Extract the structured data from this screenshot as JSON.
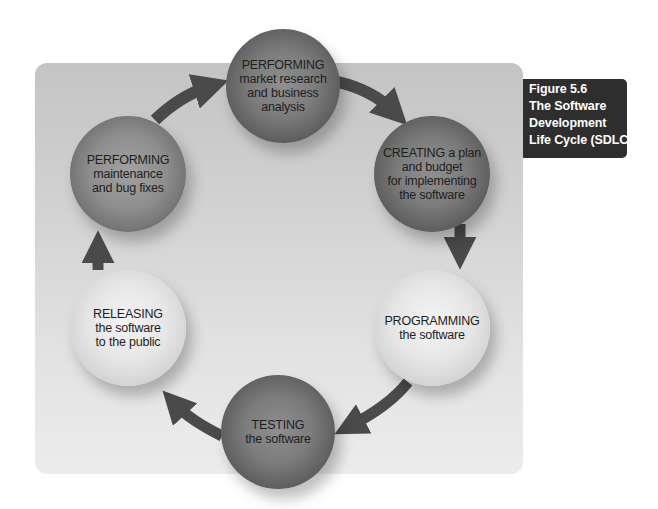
{
  "figure": {
    "caption_lines": [
      "Figure 5.6",
      "The Software",
      "Development",
      "Life Cycle (SDLC)"
    ],
    "colors": {
      "panel": "#d2d2d2",
      "arrow": "#4a4a4a",
      "caption_bg": "#2e2e2e",
      "caption_text": "#ffffff"
    }
  },
  "cycle": {
    "nodes": [
      {
        "id": "research",
        "heading": "PERFORMING",
        "body": "market research\nand business\nanalysis",
        "shade": "dark"
      },
      {
        "id": "planning",
        "heading": "CREATING a plan",
        "body": "and budget\nfor implementing\nthe software",
        "shade": "dark"
      },
      {
        "id": "programming",
        "heading": "PROGRAMMING",
        "body": "the software",
        "shade": "light"
      },
      {
        "id": "testing",
        "heading": "TESTING",
        "body": "the software",
        "shade": "dark"
      },
      {
        "id": "releasing",
        "heading": "RELEASING",
        "body": "the software\nto the public",
        "shade": "light"
      },
      {
        "id": "maintenance",
        "heading": "PERFORMING",
        "body": "maintenance\nand bug fixes",
        "shade": "mid"
      }
    ],
    "arrows": [
      {
        "from": "research",
        "to": "planning"
      },
      {
        "from": "planning",
        "to": "programming"
      },
      {
        "from": "programming",
        "to": "testing"
      },
      {
        "from": "testing",
        "to": "releasing"
      },
      {
        "from": "releasing",
        "to": "maintenance"
      },
      {
        "from": "maintenance",
        "to": "research"
      }
    ]
  }
}
